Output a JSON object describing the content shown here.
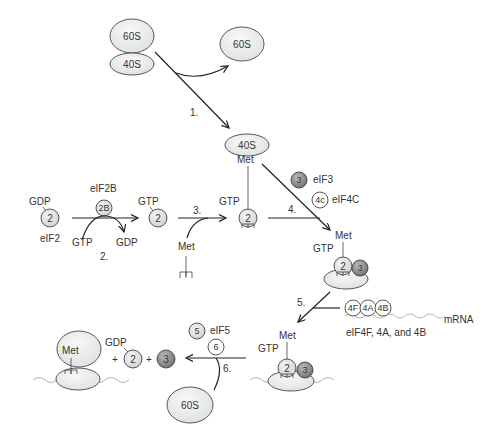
{
  "diagram": {
    "ribosome": {
      "large_subunit": "60S",
      "small_subunit": "40S"
    },
    "steps": {
      "s1": "1.",
      "s2": "2.",
      "s3": "3.",
      "s4": "4.",
      "s5": "5.",
      "s6": "6."
    },
    "labels": {
      "gdp": "GDP",
      "gtp": "GTP",
      "eif2": "eIF2",
      "eif2b": "eIF2B",
      "met": "Met",
      "eif3": "eIF3",
      "eif4c": "eIF4C",
      "mrna": "mRNA",
      "eif4f_group": "eIF4F, 4A, and 4B",
      "eif5": "eIF5",
      "plus": "+"
    },
    "factors": {
      "f2": "2",
      "f2b": "2B",
      "f3": "3",
      "f4c": "4c",
      "f4f": "4F",
      "f4a": "4A",
      "f4b": "4B",
      "f5": "5",
      "f6": "6"
    },
    "colors": {
      "subunit_fill": "#ececec",
      "factor_light": "#dcdcdc",
      "factor_dark": "#8a8a8a",
      "factor_white": "#ffffff",
      "line": "#222222"
    }
  }
}
